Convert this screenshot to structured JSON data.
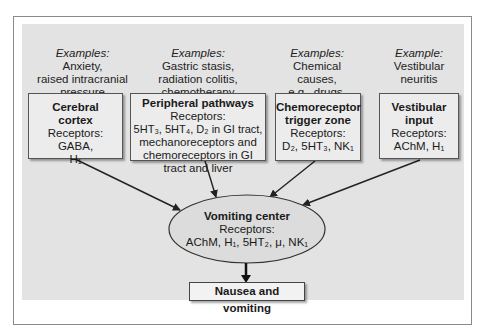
{
  "diagram": {
    "sources": [
      {
        "id": "cerebral",
        "examples_label": "Examples:",
        "examples_lines": [
          "Anxiety,",
          "raised intracranial",
          "pressure"
        ],
        "title_lines": [
          "Cerebral",
          "cortex"
        ],
        "receptors_lines": [
          "Receptors: GABA,",
          "H₁"
        ]
      },
      {
        "id": "peripheral",
        "examples_label": "Examples:",
        "examples_lines": [
          "Gastric stasis,",
          "radiation colitis,",
          "chemotherapy"
        ],
        "title_lines": [
          "Peripheral pathways"
        ],
        "receptors_lines": [
          "Receptors:",
          "5HT₃, 5HT₄, D₂ in GI tract,",
          "mechanoreceptors and",
          "chemoreceptors in GI",
          "tract and liver"
        ]
      },
      {
        "id": "ctz",
        "examples_label": "Examples:",
        "examples_lines": [
          "Chemical causes,",
          "e.g., drugs,",
          "hypercalcemia"
        ],
        "title_lines": [
          "Chemoreceptor",
          "trigger zone"
        ],
        "receptors_lines": [
          "Receptors:",
          "D₂, 5HT₃, NK₁"
        ]
      },
      {
        "id": "vestibular",
        "examples_label": "Example:",
        "examples_lines": [
          "Vestibular",
          "neuritis"
        ],
        "title_lines": [
          "Vestibular",
          "input"
        ],
        "receptors_lines": [
          "Receptors:",
          "AChM, H₁"
        ]
      }
    ],
    "center": {
      "title": "Vomiting center",
      "receptors_label": "Receptors:",
      "receptors": "AChM, H₁, 5HT₂, μ, NK₁"
    },
    "outcome": {
      "label": "Nausea and vomiting"
    },
    "colors": {
      "panel": "#e3e3e3",
      "box": "#ececec",
      "ellipse": "#dcdcdc",
      "stroke": "#222222"
    }
  }
}
